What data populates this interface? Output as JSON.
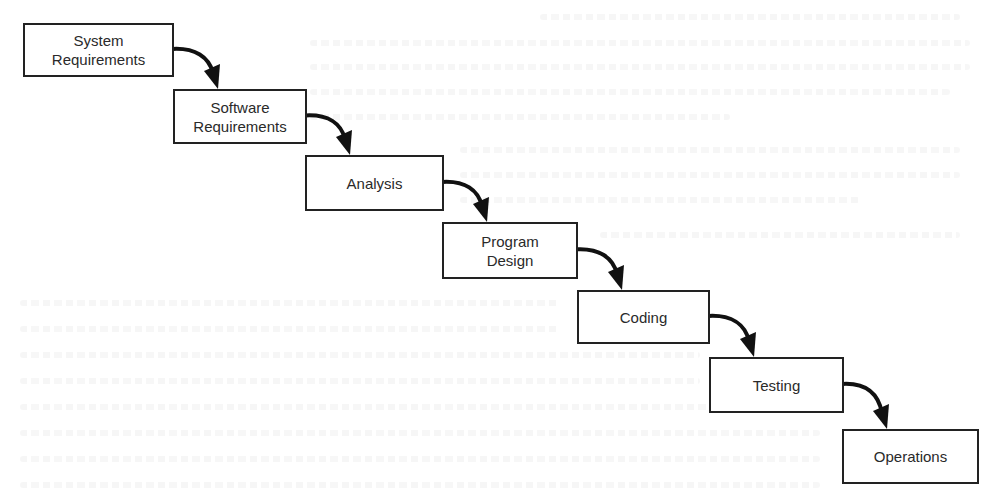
{
  "diagram": {
    "type": "waterfall-process",
    "stages": [
      {
        "id": "system-requirements",
        "label": "System\nRequirements",
        "box": {
          "x": 23,
          "y": 23,
          "w": 151,
          "h": 54
        }
      },
      {
        "id": "software-requirements",
        "label": "Software\nRequirements",
        "box": {
          "x": 173,
          "y": 89,
          "w": 134,
          "h": 55
        }
      },
      {
        "id": "analysis",
        "label": "Analysis",
        "box": {
          "x": 305,
          "y": 155,
          "w": 139,
          "h": 56
        }
      },
      {
        "id": "program-design",
        "label": "Program\nDesign",
        "box": {
          "x": 442,
          "y": 222,
          "w": 136,
          "h": 57
        }
      },
      {
        "id": "coding",
        "label": "Coding",
        "box": {
          "x": 577,
          "y": 290,
          "w": 133,
          "h": 54
        }
      },
      {
        "id": "testing",
        "label": "Testing",
        "box": {
          "x": 709,
          "y": 357,
          "w": 135,
          "h": 56
        }
      },
      {
        "id": "operations",
        "label": "Operations",
        "box": {
          "x": 842,
          "y": 429,
          "w": 137,
          "h": 55
        }
      }
    ],
    "connectors": [
      {
        "from": "system-requirements",
        "to": "software-requirements"
      },
      {
        "from": "software-requirements",
        "to": "analysis"
      },
      {
        "from": "analysis",
        "to": "program-design"
      },
      {
        "from": "program-design",
        "to": "coding"
      },
      {
        "from": "coding",
        "to": "testing"
      },
      {
        "from": "testing",
        "to": "operations"
      }
    ],
    "colors": {
      "box_border": "#222222",
      "box_fill": "#ffffff",
      "arrow": "#111111",
      "text": "#2a2a2a",
      "background": "#ffffff"
    }
  }
}
